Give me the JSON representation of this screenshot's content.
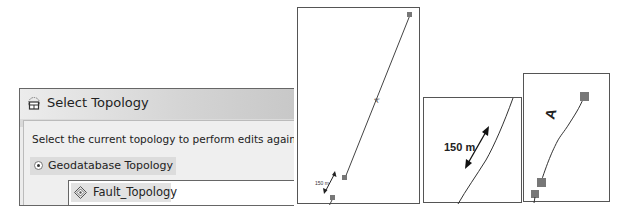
{
  "dialog": {
    "title": "Select Topology",
    "prompt": "Select the current topology to perform edits against.",
    "radio_option": "Geodatabase Topology",
    "radio_selected": true,
    "topology_item": "Fault_Topology"
  },
  "panels": [
    {
      "id": "map-view-1",
      "distance_label": "150 m",
      "line_label": "A"
    },
    {
      "id": "map-view-2",
      "distance_label": "150 m"
    },
    {
      "id": "map-view-3",
      "line_label": "A"
    }
  ],
  "colors": {
    "vertex": "#777777",
    "line": "#333333",
    "border": "#555555"
  }
}
